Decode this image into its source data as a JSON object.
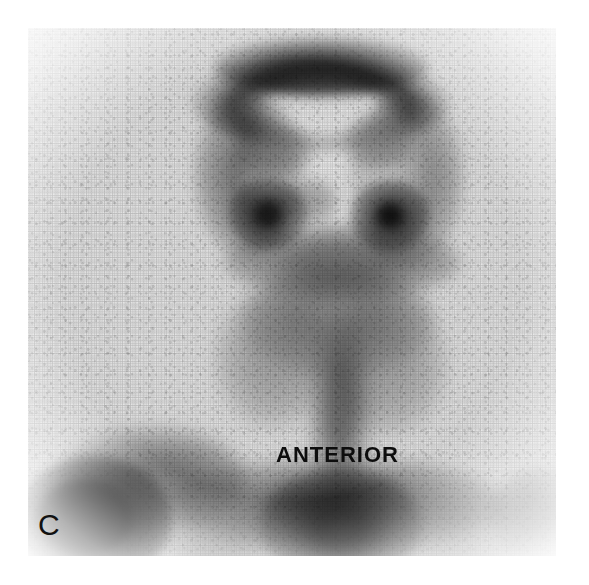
{
  "figure": {
    "panel_label": "C",
    "orientation_label": "ANTERIOR",
    "modality": "bone-scintigraphy",
    "view": "anterior",
    "colormap": "grayscale-inverted",
    "background_color": "#ffffff",
    "field_background_color": "#f7f7f7",
    "ink_color": "#0d0d0d",
    "field": {
      "x": 28,
      "y": 28,
      "width": 528,
      "height": 528
    }
  },
  "regions": [
    {
      "name": "calvarium-vertex",
      "label": "Skull vault / calvarium",
      "intensity": "high",
      "cx": 300,
      "cy": 62,
      "rx": 120,
      "ry": 44
    },
    {
      "name": "skull-left-parietal",
      "label": "Left parietal bone",
      "intensity": "moderate",
      "cx": 232,
      "cy": 135,
      "rx": 36,
      "ry": 70
    },
    {
      "name": "skull-right-parietal",
      "label": "Right parietal bone",
      "intensity": "moderate",
      "cx": 382,
      "cy": 140,
      "rx": 36,
      "ry": 72
    },
    {
      "name": "cranial-vault-center",
      "label": "Central cranial vault (photopenic)",
      "intensity": "low",
      "cx": 305,
      "cy": 140,
      "rx": 62,
      "ry": 56
    },
    {
      "name": "orbit-focus-left",
      "label": "Left orbital / maxillary focus",
      "intensity": "very-high",
      "cx": 256,
      "cy": 207,
      "rx": 16,
      "ry": 14
    },
    {
      "name": "orbit-focus-right",
      "label": "Right orbital / maxillary focus",
      "intensity": "very-high",
      "cx": 379,
      "cy": 210,
      "rx": 16,
      "ry": 14
    },
    {
      "name": "maxilla-band",
      "label": "Maxilla / nasopharynx band",
      "intensity": "high",
      "cx": 312,
      "cy": 253,
      "rx": 82,
      "ry": 22
    },
    {
      "name": "mandible",
      "label": "Mandible",
      "intensity": "moderate",
      "cx": 310,
      "cy": 300,
      "rx": 66,
      "ry": 32
    },
    {
      "name": "cervical-spine",
      "label": "Cervical spine",
      "intensity": "moderate",
      "cx": 312,
      "cy": 370,
      "rx": 26,
      "ry": 62
    },
    {
      "name": "neck-soft-tissue-left",
      "label": "Left neck soft tissue",
      "intensity": "low",
      "cx": 258,
      "cy": 340,
      "rx": 30,
      "ry": 48
    },
    {
      "name": "neck-soft-tissue-right",
      "label": "Right neck soft tissue",
      "intensity": "low",
      "cx": 372,
      "cy": 345,
      "rx": 30,
      "ry": 48
    },
    {
      "name": "clavicle-band",
      "label": "Clavicles / shoulder girdle",
      "intensity": "high",
      "cx": 310,
      "cy": 500,
      "rx": 130,
      "ry": 28
    },
    {
      "name": "sternum-manubrium",
      "label": "Manubrium / upper sternum",
      "intensity": "very-high",
      "cx": 312,
      "cy": 530,
      "rx": 46,
      "ry": 34
    },
    {
      "name": "shoulder-lesion-left",
      "label": "Focal lesion, left shoulder / proximal humerus",
      "intensity": "very-high",
      "cx": 62,
      "cy": 500,
      "rx": 46,
      "ry": 36
    },
    {
      "name": "shoulder-uptake-left",
      "label": "Left scapula / acromion uptake",
      "intensity": "moderate",
      "cx": 118,
      "cy": 462,
      "rx": 62,
      "ry": 26
    },
    {
      "name": "shoulder-uptake-right",
      "label": "Right shoulder uptake",
      "intensity": "low",
      "cx": 530,
      "cy": 500,
      "rx": 26,
      "ry": 24
    }
  ]
}
